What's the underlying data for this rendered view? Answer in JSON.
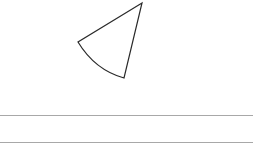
{
  "figure": {
    "shape": "sector",
    "stroke_color": "#2a2a2a",
    "fill_color": "#ffffff",
    "apex": [
      142,
      3
    ],
    "edge_point_a": [
      78,
      42
    ],
    "edge_point_b": [
      124,
      78
    ]
  },
  "rules": {
    "color": "#a8a8a8",
    "lines": [
      {
        "y": 115,
        "x_start": 0,
        "x_end": 253
      },
      {
        "y": 142,
        "x_start": 0,
        "x_end": 253
      }
    ]
  }
}
